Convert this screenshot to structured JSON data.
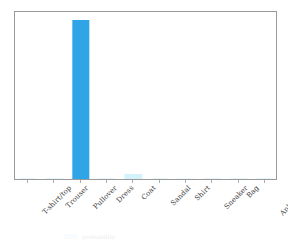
{
  "chart_data": {
    "type": "bar",
    "title": "",
    "xlabel": "",
    "ylabel": "",
    "grid": false,
    "legend_position": "below-axes-clipped",
    "ylim": [
      0,
      1.05
    ],
    "categories": [
      "T-shirt/top",
      "Trouser",
      "Pullover",
      "Dress",
      "Coat",
      "Sandal",
      "Shirt",
      "Sneaker",
      "Bag",
      "Ankle boot"
    ],
    "values": [
      0.0,
      0.0,
      1.0,
      0.0,
      0.03,
      0.0,
      0.005,
      0.0,
      0.0,
      0.0
    ],
    "bar_colors": [
      "#e8f7fd",
      "#e8f7fd",
      "#2fa4e7",
      "#e8f7fd",
      "#d4f2fb",
      "#e8f7fd",
      "#eefafd",
      "#e8f7fd",
      "#e8f7fd",
      "#e8f7fd"
    ],
    "annotations": []
  },
  "style": {
    "background": "#ffffff",
    "frame_color": "#9a9a9a",
    "tick_color": "#adadad",
    "label_color": "#3b3b3b",
    "accent": "#2fa4e7"
  },
  "legend_remnant": {
    "swatch_color": "#bfe9fa",
    "text": "probability"
  }
}
